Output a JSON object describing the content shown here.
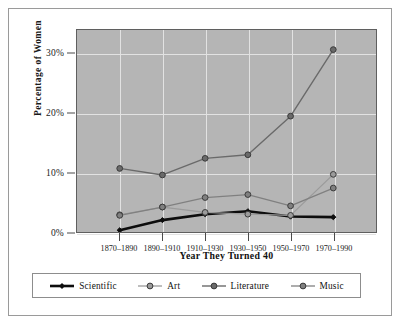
{
  "chart_data": {
    "type": "line",
    "title": "",
    "xlabel": "Year They Turned 40",
    "ylabel": "Percentage of Women",
    "categories": [
      "1870–1890",
      "1890–1910",
      "1910–1930",
      "1930–1950",
      "1950–1970",
      "1970–1990"
    ],
    "ylim": [
      0,
      34
    ],
    "yticks": [
      0,
      10,
      20,
      30
    ],
    "ytick_labels": [
      "0%",
      "10%",
      "20%",
      "30%"
    ],
    "grid": true,
    "legend_position": "bottom",
    "plot_background": "#b5b5b5",
    "series": [
      {
        "name": "Scientific",
        "color": "#0d0d0d",
        "marker": "diamond",
        "line_width": 2.6,
        "values": [
          0.3,
          2.0,
          3.0,
          3.5,
          2.6,
          2.5
        ]
      },
      {
        "name": "Art",
        "color": "#9b9b9b",
        "marker": "circle",
        "line_width": 1.3,
        "values": [
          2.9,
          4.2,
          3.3,
          3.0,
          2.8,
          9.7
        ]
      },
      {
        "name": "Literature",
        "color": "#6a6a6a",
        "marker": "circle",
        "line_width": 1.4,
        "values": [
          10.7,
          9.6,
          12.4,
          13.0,
          19.5,
          30.7
        ]
      },
      {
        "name": "Music",
        "color": "#808080",
        "marker": "circle",
        "line_width": 1.3,
        "values": [
          2.8,
          4.2,
          5.8,
          6.3,
          4.4,
          7.4
        ]
      }
    ]
  },
  "legend": {
    "items": [
      {
        "label": "Scientific"
      },
      {
        "label": "Art"
      },
      {
        "label": "Literature"
      },
      {
        "label": "Music"
      }
    ]
  }
}
